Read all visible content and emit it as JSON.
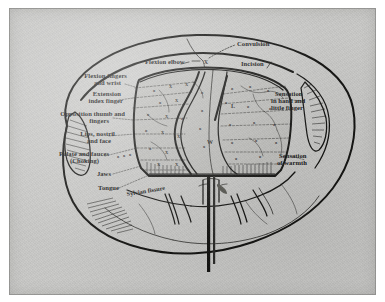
{
  "plate": {
    "title": "Diagram of cerebral cortical localization with craniotomy exposure",
    "medium": "engraved line illustration on toned paper",
    "background_color": "#c9c9c7",
    "ink_color": "#121210"
  },
  "labels": {
    "left": [
      {
        "id": "flexion-fingers-wrist",
        "lines": [
          "Flexion fingers",
          "and wrist"
        ]
      },
      {
        "id": "extension-index-finger",
        "lines": [
          "Extension",
          "index finger"
        ]
      },
      {
        "id": "opposition-thumb",
        "lines": [
          "Opposition thumb and",
          "fingers"
        ]
      },
      {
        "id": "lips-nostril-face",
        "lines": [
          "Lips, nostril",
          "and face"
        ]
      },
      {
        "id": "palate-fauces",
        "lines": [
          "Palate and fauces",
          "(Choking)"
        ]
      },
      {
        "id": "jaws",
        "lines": [
          "Jaws"
        ]
      },
      {
        "id": "tongue",
        "lines": [
          "Tongue"
        ]
      }
    ],
    "top": [
      {
        "id": "flexion-elbow",
        "lines": [
          "Flexion elbow"
        ]
      },
      {
        "id": "convulsion",
        "lines": [
          "Convulsion"
        ]
      }
    ],
    "right": [
      {
        "id": "incision",
        "lines": [
          "Incision"
        ]
      },
      {
        "id": "sensation-hand-finger",
        "lines": [
          "Sensation",
          "in hand and",
          "little finger"
        ]
      },
      {
        "id": "sensation-warmth",
        "lines": [
          "Sensation",
          "of warmth"
        ]
      }
    ],
    "inner": [
      {
        "id": "sylvian-fissure",
        "lines": [
          "Sylvian fissure"
        ]
      }
    ]
  },
  "markers": {
    "convulsion_point": "X",
    "cortex_points": [
      "X",
      "X",
      "X",
      "X",
      "X",
      "X",
      "X",
      "X",
      "o",
      "o",
      "o",
      "o",
      "o",
      "o",
      "o",
      "o",
      "o",
      "o",
      "W",
      "L"
    ]
  }
}
